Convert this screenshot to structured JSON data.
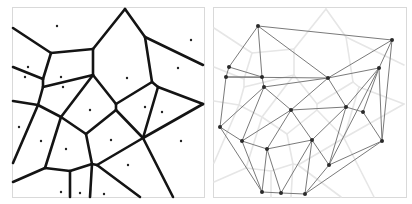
{
  "figure": {
    "width": 412,
    "height": 204,
    "background": "#ffffff",
    "frame_color": "#d9d9d9",
    "panels": [
      {
        "id": "voronoi",
        "label": "Voronoi diagram",
        "frame": {
          "x": 12,
          "y": 7,
          "w": 192,
          "h": 190
        },
        "edge_color": "#141414",
        "edge_width": 2.6,
        "site_color": "#222222",
        "site_radius": 1.2
      },
      {
        "id": "delaunay",
        "label": "Delaunay triangulation",
        "frame": {
          "x": 213,
          "y": 7,
          "w": 193,
          "h": 190
        },
        "edge_color": "#7a7a7a",
        "edge_width": 1.0,
        "ghost_color": "#e6e6e6",
        "ghost_width": 1.6,
        "site_color": "#2a2a2a",
        "site_radius": 2.0
      }
    ],
    "panel_offset_x": 201
  },
  "sites": [
    [
      258,
      26
    ],
    [
      392,
      40
    ],
    [
      229,
      67
    ],
    [
      226,
      77
    ],
    [
      262,
      77
    ],
    [
      264,
      87
    ],
    [
      328,
      78
    ],
    [
      379,
      68
    ],
    [
      291,
      110
    ],
    [
      346,
      107
    ],
    [
      363,
      112
    ],
    [
      220,
      127
    ],
    [
      242,
      141
    ],
    [
      267,
      149
    ],
    [
      312,
      140
    ],
    [
      382,
      141
    ],
    [
      329,
      165
    ],
    [
      262,
      192
    ],
    [
      281,
      193
    ],
    [
      305,
      194
    ]
  ],
  "voronoi_edges": [
    [
      [
        13,
        28
      ],
      [
        51,
        53
      ]
    ],
    [
      [
        51,
        53
      ],
      [
        93,
        49
      ]
    ],
    [
      [
        93,
        49
      ],
      [
        125,
        9
      ]
    ],
    [
      [
        125,
        9
      ],
      [
        145,
        37
      ]
    ],
    [
      [
        145,
        37
      ],
      [
        203,
        65
      ]
    ],
    [
      [
        145,
        37
      ],
      [
        152,
        82
      ]
    ],
    [
      [
        93,
        49
      ],
      [
        93,
        75
      ]
    ],
    [
      [
        51,
        53
      ],
      [
        43,
        79
      ]
    ],
    [
      [
        13,
        67
      ],
      [
        43,
        79
      ]
    ],
    [
      [
        43,
        79
      ],
      [
        43,
        87
      ]
    ],
    [
      [
        43,
        87
      ],
      [
        93,
        75
      ]
    ],
    [
      [
        43,
        87
      ],
      [
        38,
        105
      ]
    ],
    [
      [
        13,
        101
      ],
      [
        38,
        105
      ]
    ],
    [
      [
        38,
        105
      ],
      [
        61,
        117
      ]
    ],
    [
      [
        93,
        75
      ],
      [
        61,
        117
      ]
    ],
    [
      [
        93,
        75
      ],
      [
        116,
        104
      ]
    ],
    [
      [
        116,
        104
      ],
      [
        152,
        82
      ]
    ],
    [
      [
        152,
        82
      ],
      [
        158,
        87
      ]
    ],
    [
      [
        158,
        87
      ],
      [
        203,
        104
      ]
    ],
    [
      [
        158,
        87
      ],
      [
        143,
        138
      ]
    ],
    [
      [
        203,
        104
      ],
      [
        143,
        138
      ]
    ],
    [
      [
        116,
        104
      ],
      [
        116,
        110
      ]
    ],
    [
      [
        116,
        110
      ],
      [
        86,
        134
      ]
    ],
    [
      [
        116,
        110
      ],
      [
        143,
        138
      ]
    ],
    [
      [
        61,
        117
      ],
      [
        86,
        134
      ]
    ],
    [
      [
        38,
        105
      ],
      [
        13,
        163
      ]
    ],
    [
      [
        61,
        117
      ],
      [
        45,
        168
      ]
    ],
    [
      [
        45,
        168
      ],
      [
        13,
        182
      ]
    ],
    [
      [
        45,
        168
      ],
      [
        70,
        171
      ]
    ],
    [
      [
        70,
        171
      ],
      [
        92,
        164
      ]
    ],
    [
      [
        70,
        171
      ],
      [
        70,
        197
      ]
    ],
    [
      [
        86,
        134
      ],
      [
        92,
        164
      ]
    ],
    [
      [
        92,
        164
      ],
      [
        97,
        165
      ]
    ],
    [
      [
        92,
        164
      ],
      [
        90,
        197
      ]
    ],
    [
      [
        97,
        165
      ],
      [
        143,
        138
      ]
    ],
    [
      [
        97,
        165
      ],
      [
        140,
        197
      ]
    ],
    [
      [
        143,
        138
      ],
      [
        173,
        197
      ]
    ]
  ],
  "delaunay_edges": [
    [
      0,
      1
    ],
    [
      0,
      2
    ],
    [
      0,
      4
    ],
    [
      0,
      6
    ],
    [
      1,
      7
    ],
    [
      1,
      15
    ],
    [
      1,
      6
    ],
    [
      2,
      4
    ],
    [
      2,
      3
    ],
    [
      3,
      4
    ],
    [
      3,
      6
    ],
    [
      3,
      11
    ],
    [
      4,
      5
    ],
    [
      5,
      6
    ],
    [
      5,
      8
    ],
    [
      5,
      11
    ],
    [
      5,
      12
    ],
    [
      6,
      7
    ],
    [
      6,
      8
    ],
    [
      6,
      9
    ],
    [
      7,
      9
    ],
    [
      7,
      10
    ],
    [
      7,
      15
    ],
    [
      7,
      16
    ],
    [
      8,
      9
    ],
    [
      8,
      12
    ],
    [
      8,
      13
    ],
    [
      8,
      14
    ],
    [
      9,
      10
    ],
    [
      9,
      14
    ],
    [
      9,
      16
    ],
    [
      10,
      15
    ],
    [
      11,
      12
    ],
    [
      11,
      17
    ],
    [
      12,
      13
    ],
    [
      12,
      17
    ],
    [
      13,
      14
    ],
    [
      13,
      17
    ],
    [
      13,
      18
    ],
    [
      14,
      16
    ],
    [
      14,
      18
    ],
    [
      14,
      19
    ],
    [
      15,
      16
    ],
    [
      15,
      19
    ],
    [
      16,
      19
    ],
    [
      17,
      18
    ],
    [
      18,
      19
    ]
  ]
}
